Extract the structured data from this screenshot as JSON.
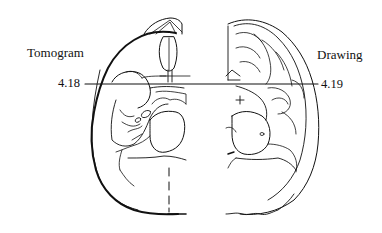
{
  "figure": {
    "left_panel": {
      "label": "Tomogram",
      "line_marker": "4.18"
    },
    "right_panel": {
      "label": "Drawing",
      "line_marker": "4.19"
    },
    "colors": {
      "line": "#111111",
      "background": "#ffffff"
    }
  }
}
